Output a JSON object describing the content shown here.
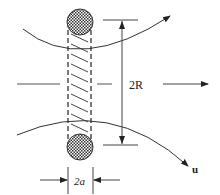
{
  "diagram": {
    "labels": {
      "radius_span": "2R",
      "width_span": "2a",
      "velocity": "u"
    },
    "elements": {
      "top_cross_section": "hatched circle (vortex core, top)",
      "bottom_cross_section": "hatched circle (vortex core, bottom)",
      "tube": "dashed vortex tube with diagonal hatching",
      "streamlines": [
        "upper curved streamline",
        "lower curved streamline with arrow u"
      ],
      "flow_arrow": "horizontal arrow to the right"
    },
    "colors": {
      "stroke": "#333333",
      "background": "#ffffff"
    }
  }
}
